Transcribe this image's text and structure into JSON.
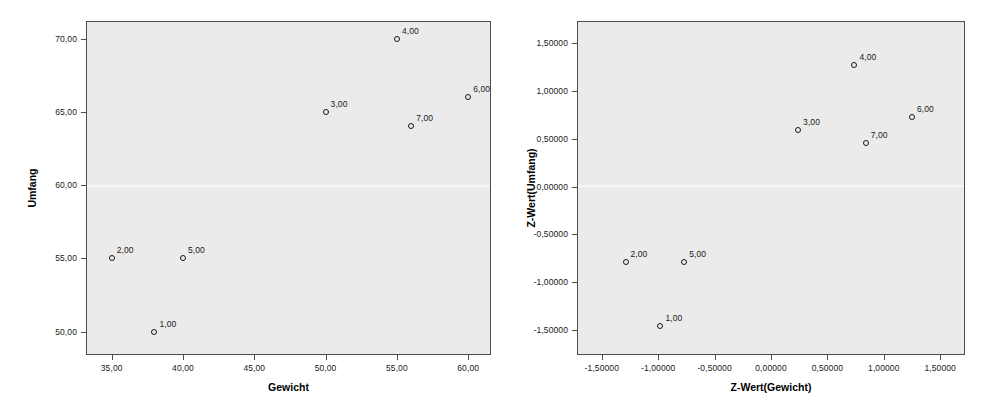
{
  "chart_data": [
    {
      "id": "left",
      "type": "scatter",
      "title": "",
      "xlabel": "Gewicht",
      "ylabel": "Umfang",
      "xlim": [
        33.2,
        61.6
      ],
      "ylim": [
        48.4,
        71.2
      ],
      "xticks": [
        35,
        40,
        45,
        50,
        55,
        60
      ],
      "xticklabels": [
        "35,00",
        "40,00",
        "45,00",
        "50,00",
        "55,00",
        "60,00"
      ],
      "yticks": [
        50,
        55,
        60,
        65,
        70
      ],
      "yticklabels": [
        "50,00",
        "55,00",
        "60,00",
        "65,00",
        "70,00"
      ],
      "grid": false,
      "legend": "none",
      "points": [
        {
          "label": "1,00",
          "x": 38,
          "y": 50
        },
        {
          "label": "2,00",
          "x": 35,
          "y": 55
        },
        {
          "label": "3,00",
          "x": 50,
          "y": 65
        },
        {
          "label": "4,00",
          "x": 55,
          "y": 70
        },
        {
          "label": "5,00",
          "x": 40,
          "y": 55
        },
        {
          "label": "6,00",
          "x": 60,
          "y": 66
        },
        {
          "label": "7,00",
          "x": 56,
          "y": 64
        }
      ]
    },
    {
      "id": "right",
      "type": "scatter",
      "title": "",
      "xlabel": "Z-Wert(Gewicht)",
      "ylabel": "Z-Wert(Umfang)",
      "xlim": [
        -1.72,
        1.72
      ],
      "ylim": [
        -1.76,
        1.73
      ],
      "xticks": [
        -1.5,
        -1.0,
        -0.5,
        0.0,
        0.5,
        1.0,
        1.5
      ],
      "xticklabels": [
        "-1,50000",
        "-1,00000",
        "-0,50000",
        "0,00000",
        "0,50000",
        "1,00000",
        "1,50000"
      ],
      "yticks": [
        -1.5,
        -1.0,
        -0.5,
        0.0,
        0.5,
        1.0,
        1.5
      ],
      "yticklabels": [
        "-1,50000",
        "-1,00000",
        "-0,50000",
        "0,00000",
        "0,50000",
        "1,00000",
        "1,50000"
      ],
      "grid": false,
      "legend": "none",
      "points": [
        {
          "label": "1,00",
          "x": -0.98,
          "y": -1.46
        },
        {
          "label": "2,00",
          "x": -1.29,
          "y": -0.79
        },
        {
          "label": "3,00",
          "x": 0.24,
          "y": 0.59
        },
        {
          "label": "4,00",
          "x": 0.74,
          "y": 1.27
        },
        {
          "label": "5,00",
          "x": -0.77,
          "y": -0.79
        },
        {
          "label": "6,00",
          "x": 1.25,
          "y": 0.73
        },
        {
          "label": "7,00",
          "x": 0.84,
          "y": 0.45
        }
      ]
    }
  ],
  "layout": {
    "left_plot": {
      "x": 86,
      "y": 21,
      "w": 405,
      "h": 334
    },
    "right_plot": {
      "x": 577,
      "y": 21,
      "w": 388,
      "h": 334
    },
    "colors": {
      "plot_background": "#ebebeb",
      "frame": "#4d4d4d",
      "text": "#1a1a1a",
      "marker": "#1a1a1a",
      "page_background": "#ffffff"
    }
  }
}
